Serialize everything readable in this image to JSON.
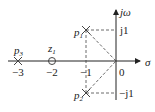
{
  "diagram": {
    "type": "pole-zero plot (s-plane)",
    "axes": {
      "real_label": "σ",
      "imag_label": "jω"
    },
    "real_ticks": [
      "−3",
      "−2",
      "−1",
      "0"
    ],
    "imag_ticks": [
      "j1",
      "−j1"
    ],
    "poles": [
      {
        "label": "p",
        "sub": "1",
        "re": -1,
        "im": 1
      },
      {
        "label": "p",
        "sub": "2",
        "re": -1,
        "im": -1
      },
      {
        "label": "p",
        "sub": "3",
        "re": -3,
        "im": 0
      }
    ],
    "zeros": [
      {
        "label": "z",
        "sub": "1",
        "re": -2,
        "im": 0
      }
    ]
  }
}
